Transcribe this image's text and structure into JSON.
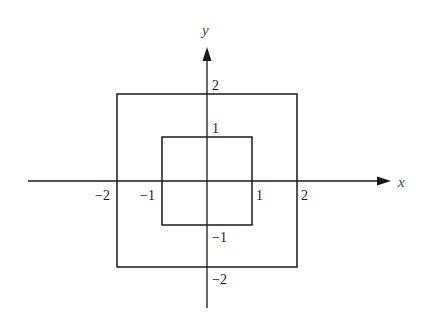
{
  "diagram": {
    "axes": {
      "x_label": "x",
      "y_label": "y"
    },
    "squares": [
      {
        "name": "outer-square",
        "half_side": 2
      },
      {
        "name": "inner-square",
        "half_side": 1
      }
    ],
    "ticks": {
      "x_neg2": "−2",
      "x_neg1": "−1",
      "x_pos1": "1",
      "x_pos2": "2",
      "y_pos2": "2",
      "y_pos1": "1",
      "y_neg1": "−1",
      "y_neg2": "−2"
    }
  }
}
